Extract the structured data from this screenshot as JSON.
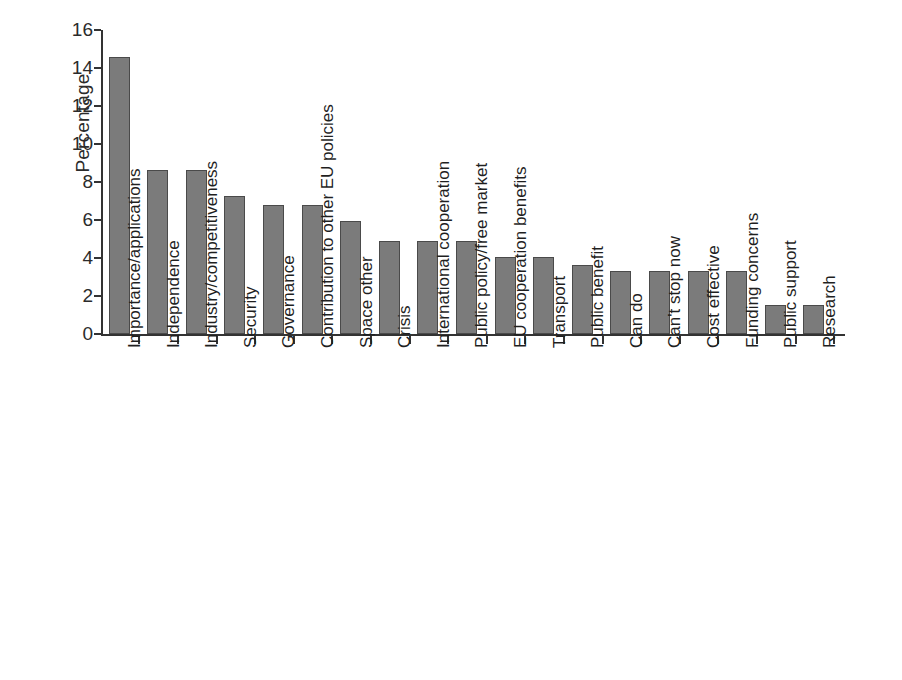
{
  "chart_data": {
    "type": "bar",
    "title": "",
    "subtitle": "",
    "xlabel": "",
    "ylabel": "Percentage",
    "ylim": [
      0,
      16
    ],
    "yticks": [
      0,
      2,
      4,
      6,
      8,
      10,
      12,
      14,
      16
    ],
    "ytick_labels": [
      "0",
      "2",
      "4",
      "6",
      "8",
      "10",
      "12",
      "14",
      "16"
    ],
    "grid": false,
    "legend": null,
    "orientation": "vertical",
    "bar_color": "#7b7b7b",
    "bar_edge_color": "#4a4a4a",
    "axis_color": "#333333",
    "categories": [
      "Importance/applications",
      "Independence",
      "Industry/competitiveness",
      "Security",
      "Governance",
      "Contribution to other EU policies",
      "Space other",
      "Crisis",
      "International cooperation",
      "Public policy/free market",
      "EU cooperation benefits",
      "Transport",
      "Public benefit",
      "Can do",
      "Can't stop now",
      "Cost effective",
      "Funding concerns",
      "Public support",
      "Research"
    ],
    "values": [
      14.6,
      8.65,
      8.65,
      7.25,
      6.8,
      6.8,
      5.95,
      4.9,
      4.9,
      4.9,
      4.05,
      4.05,
      3.65,
      3.3,
      3.3,
      3.3,
      3.3,
      1.55,
      1.55
    ]
  }
}
